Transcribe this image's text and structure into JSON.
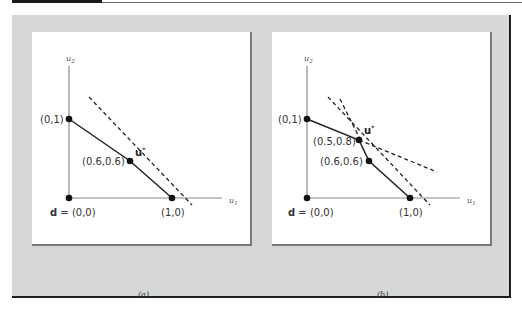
{
  "figure": {
    "captions": {
      "a": "(a)",
      "b": "(b)"
    },
    "axis_labels": {
      "x": "u",
      "x_sub": "1",
      "y": "u",
      "y_sub": "2"
    },
    "panels": [
      {
        "id": "a",
        "points": [
          {
            "label": "d = (0,0)",
            "bold_prefix": "d",
            "rest": " = (0,0)",
            "x": 0,
            "y": 0
          },
          {
            "label": "(0,1)",
            "x": 0,
            "y": 1
          },
          {
            "label": "(1,0)",
            "x": 1,
            "y": 0
          },
          {
            "label": "(0.6,0.6)",
            "x": 0.6,
            "y": 0.6,
            "marker": "u*"
          }
        ],
        "solid_frontier": [
          [
            0,
            1
          ],
          [
            0.6,
            0.6
          ],
          [
            1,
            0
          ]
        ],
        "dashed_lines": 1,
        "u_star": {
          "label": "u",
          "sup": "*"
        },
        "labels": {
          "origin_bold": "d",
          "origin_rest": " = (0,0)",
          "p01": "(0,1)",
          "p10": "(1,0)",
          "p66": "(0.6,0.6)"
        }
      },
      {
        "id": "b",
        "points": [
          {
            "label": "d = (0,0)",
            "x": 0,
            "y": 0
          },
          {
            "label": "(0,1)",
            "x": 0,
            "y": 1
          },
          {
            "label": "(1,0)",
            "x": 1,
            "y": 0
          },
          {
            "label": "(0.5,0.8)",
            "x": 0.5,
            "y": 0.8,
            "marker": "u*"
          },
          {
            "label": "(0.6,0.6)",
            "x": 0.6,
            "y": 0.6
          }
        ],
        "solid_frontier": [
          [
            0,
            1
          ],
          [
            0.5,
            0.8
          ],
          [
            0.6,
            0.6
          ],
          [
            1,
            0
          ]
        ],
        "dashed_lines": 2,
        "u_star": {
          "label": "u",
          "sup": "*"
        },
        "labels": {
          "origin_bold": "d",
          "origin_rest": " = (0,0)",
          "p01": "(0,1)",
          "p10": "(1,0)",
          "p58": "(0.5,0.8)",
          "p66": "(0.6,0.6)"
        }
      }
    ]
  },
  "colors": {
    "frame_bg": "#d6d8d7",
    "panel_bg": "#ffffff",
    "axis": "#8a8a8a",
    "line": "#222222",
    "text": "#333333"
  }
}
